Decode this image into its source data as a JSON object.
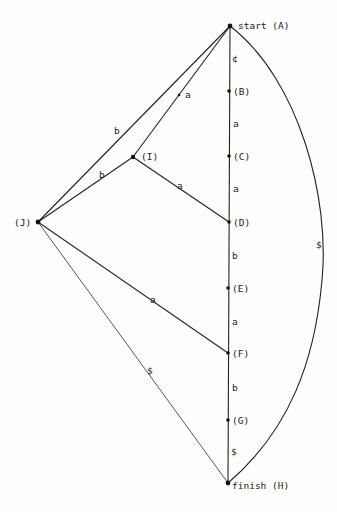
{
  "diagram": {
    "type": "state-graph",
    "nodes": {
      "A": {
        "label": "start (A)"
      },
      "B": {
        "label": "(B)"
      },
      "C": {
        "label": "(C)"
      },
      "D": {
        "label": "(D)"
      },
      "E": {
        "label": "(E)"
      },
      "F": {
        "label": "(F)"
      },
      "G": {
        "label": "(G)"
      },
      "H": {
        "label": "finish (H)"
      },
      "I": {
        "label": "(I)"
      },
      "J": {
        "label": "(J)"
      }
    },
    "edges": {
      "AB": {
        "from": "A",
        "to": "B",
        "label": "¢"
      },
      "BC": {
        "from": "B",
        "to": "C",
        "label": "a"
      },
      "CD": {
        "from": "C",
        "to": "D",
        "label": "a"
      },
      "DE": {
        "from": "D",
        "to": "E",
        "label": "b"
      },
      "EF": {
        "from": "E",
        "to": "F",
        "label": "a"
      },
      "FG": {
        "from": "F",
        "to": "G",
        "label": "b"
      },
      "GH": {
        "from": "G",
        "to": "H",
        "label": "$"
      },
      "AH": {
        "from": "A",
        "to": "H",
        "label": "$"
      },
      "AI": {
        "from": "A",
        "to": "I",
        "label": "a"
      },
      "ID": {
        "from": "I",
        "to": "D",
        "label": "a"
      },
      "AJ": {
        "from": "A",
        "to": "J",
        "label": "b"
      },
      "JI": {
        "from": "J",
        "to": "I",
        "label": "b"
      },
      "JF": {
        "from": "J",
        "to": "F",
        "label": "a"
      },
      "JH": {
        "from": "J",
        "to": "H",
        "label": "$"
      }
    }
  }
}
